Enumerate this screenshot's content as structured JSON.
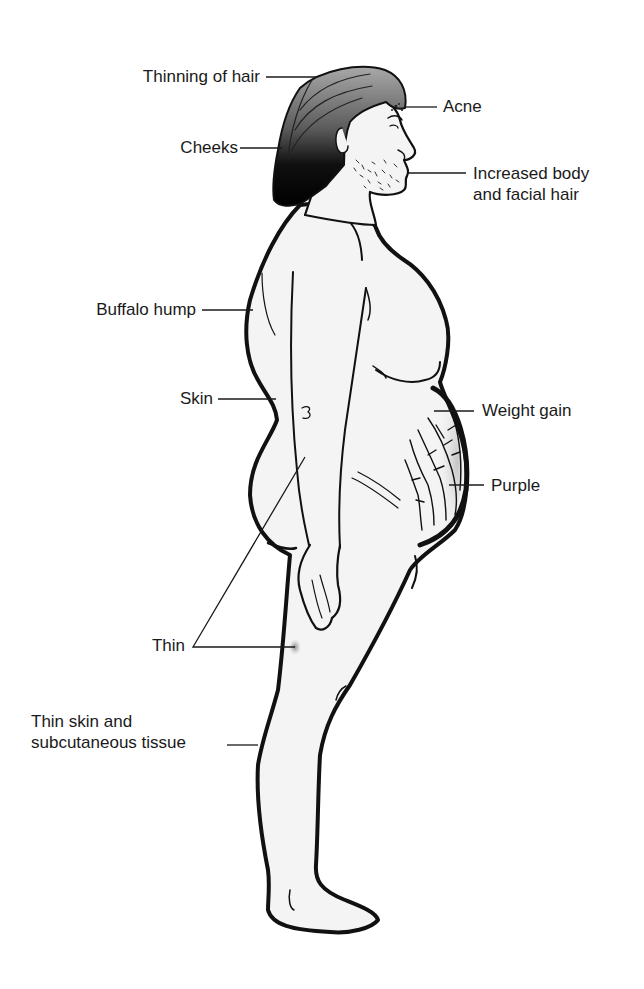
{
  "diagram": {
    "labels": [
      {
        "id": "thinning-hair",
        "text": "Thinning of hair"
      },
      {
        "id": "acne",
        "text": "Acne"
      },
      {
        "id": "cheeks",
        "text": "Cheeks"
      },
      {
        "id": "body-facial-hair",
        "text": "Increased body\nand facial hair"
      },
      {
        "id": "buffalo-hump",
        "text": "Buffalo hump"
      },
      {
        "id": "skin",
        "text": "Skin"
      },
      {
        "id": "weight-gain",
        "text": "Weight gain"
      },
      {
        "id": "purple",
        "text": "Purple"
      },
      {
        "id": "thin",
        "text": "Thin"
      },
      {
        "id": "thin-skin",
        "text": "Thin skin and\nsubcutaneous tissue"
      }
    ],
    "colors": {
      "outline": "#111111",
      "skin": "#f4f4f4",
      "hair_dark": "#0d0d0d",
      "hair_light": "#9a9a9a",
      "bruise": "#9c9c9c",
      "text": "#1a1a1a"
    }
  }
}
